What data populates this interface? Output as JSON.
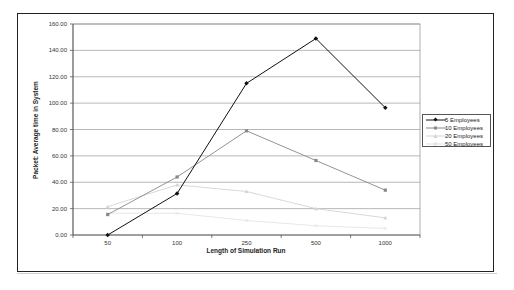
{
  "chart_data": {
    "type": "line",
    "title": "",
    "xlabel": "Length of Simulation Run",
    "ylabel": "Packet: Average time in System",
    "categories": [
      "50",
      "100",
      "250",
      "500",
      "1000"
    ],
    "ylim": [
      0,
      160
    ],
    "yticks": [
      "0.00",
      "20.00",
      "40.00",
      "60.00",
      "80.00",
      "100.00",
      "120.00",
      "140.00",
      "160.00"
    ],
    "grid": true,
    "legend_position": "right",
    "series": [
      {
        "name": "5 Employees",
        "values": [
          0,
          31.5,
          115,
          149,
          96.5
        ],
        "color": "#111111",
        "marker": "diamond"
      },
      {
        "name": "10 Employees",
        "values": [
          15.5,
          44,
          79,
          56.5,
          34
        ],
        "color": "#888888",
        "marker": "square"
      },
      {
        "name": "20 Employees",
        "values": [
          21.5,
          38,
          33,
          20,
          13
        ],
        "color": "#d4d4d4",
        "marker": "triangle"
      },
      {
        "name": "50 Employees",
        "values": [
          16.5,
          16.5,
          11,
          7,
          5
        ],
        "color": "#e4e4e4",
        "marker": "x"
      }
    ]
  },
  "legend": {
    "items": [
      "5 Employees",
      "10 Employees",
      "20 Employees",
      "50 Employees"
    ]
  }
}
